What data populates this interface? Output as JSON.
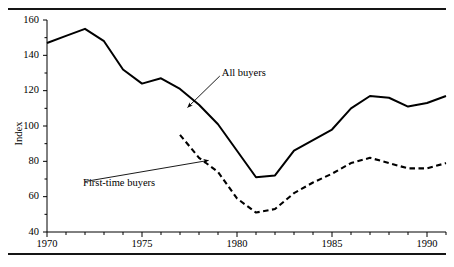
{
  "figure": {
    "ylabel": "Index",
    "series_labels": {
      "all_buyers": "All buyers",
      "first_time_buyers": "First-time buyers"
    }
  },
  "chart_data": {
    "type": "line",
    "title": "",
    "xlabel": "",
    "ylabel": "Index",
    "xlim": [
      1970,
      1991
    ],
    "ylim": [
      40,
      160
    ],
    "ytick_major": [
      40,
      60,
      80,
      100,
      120,
      140,
      160
    ],
    "ytick_minor": [
      50,
      70,
      90,
      110,
      130,
      150
    ],
    "xtick_labels": [
      "1970",
      "1975",
      "1980",
      "1985",
      "1990"
    ],
    "xtick_label_values": [
      1970,
      1975,
      1980,
      1985,
      1990
    ],
    "xtick_minor_values": [
      1971,
      1972,
      1973,
      1974,
      1976,
      1977,
      1978,
      1979,
      1981,
      1982,
      1983,
      1984,
      1986,
      1987,
      1988,
      1989,
      1991
    ],
    "grid": false,
    "legend": "annotations",
    "series": [
      {
        "name": "All buyers",
        "style": "solid",
        "color": "#000000",
        "x": [
          1970,
          1971,
          1972,
          1973,
          1974,
          1975,
          1976,
          1977,
          1978,
          1979,
          1980,
          1981,
          1982,
          1983,
          1984,
          1985,
          1986,
          1987,
          1988,
          1989,
          1990,
          1991
        ],
        "values": [
          147,
          151,
          155,
          148,
          132,
          124,
          127,
          121,
          112,
          101,
          86,
          71,
          72,
          86,
          92,
          98,
          110,
          117,
          116,
          111,
          113,
          117
        ]
      },
      {
        "name": "First-time buyers",
        "style": "dashed",
        "color": "#000000",
        "x": [
          1977,
          1978,
          1979,
          1980,
          1981,
          1982,
          1983,
          1984,
          1985,
          1986,
          1987,
          1988,
          1989,
          1990,
          1991
        ],
        "values": [
          95,
          82,
          74,
          59,
          51,
          53,
          62,
          68,
          73,
          79,
          82,
          79,
          76,
          76,
          79
        ]
      }
    ],
    "annotations": [
      {
        "text": "All buyers",
        "label_x": 1979.2,
        "label_y": 130,
        "arrow_to_x": 1977.4,
        "arrow_to_y": 110.5
      },
      {
        "text": "First-time buyers",
        "label_x": 1971.9,
        "label_y": 68,
        "arrow_to_x": 1978.5,
        "arrow_to_y": 80.5
      }
    ]
  }
}
